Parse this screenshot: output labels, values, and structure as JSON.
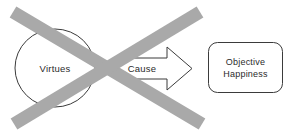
{
  "diagram": {
    "nodes": {
      "virtues": {
        "label": "Virtues",
        "shape": "ellipse"
      },
      "objective_happiness": {
        "label_line1": "Objective",
        "label_line2": "Happiness",
        "shape": "rounded-rectangle"
      }
    },
    "connector": {
      "label": "Cause",
      "shape": "block-arrow",
      "direction": "right"
    },
    "negation": {
      "name": "cross-out",
      "shape": "x-mark",
      "color": "#a9a9a9"
    },
    "colors": {
      "outline": "#3b3b3b",
      "text": "#2b2b2b",
      "cross": "#a9a9a9",
      "background": "#ffffff"
    }
  }
}
